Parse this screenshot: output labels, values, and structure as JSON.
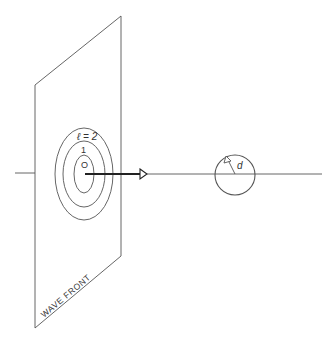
{
  "diagram": {
    "type": "physics-schematic",
    "colors": {
      "line": "#555555",
      "arrow": "#222222",
      "text": "#333333",
      "background": "#ffffff"
    },
    "wave_front": {
      "label": "WAVE FRONT"
    },
    "zones": {
      "outer_label": "ℓ = 2",
      "middle_label": "1",
      "inner_label": "O"
    },
    "aperture": {
      "radius_label": "d"
    }
  }
}
